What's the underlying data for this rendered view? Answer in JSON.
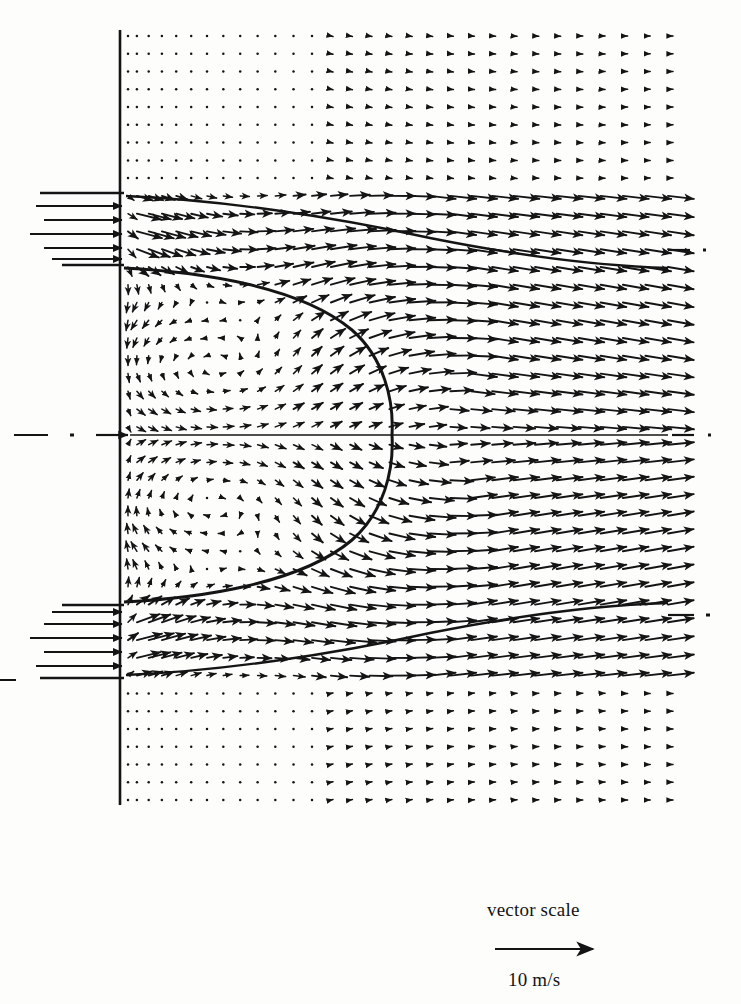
{
  "figure": {
    "kind": "vector-field-plot",
    "background_color": "#fdfdfc",
    "ink_color": "#141414"
  },
  "legend": {
    "title": "vector scale",
    "value_label": "10 m/s",
    "arrow_length_px": 100,
    "arrow_x_start": 495,
    "arrow_x_end": 595,
    "arrow_y": 949,
    "title_x": 487,
    "title_y": 916,
    "value_x": 508,
    "value_y": 986
  },
  "geometry": {
    "wall_x": 120,
    "wall_y_top": 30,
    "wall_y_bottom": 805,
    "domain_right": 672,
    "centerline_y": 435,
    "inlet_top_upper_y": 193,
    "inlet_top_lower_y": 265,
    "inlet_bottom_upper_y": 605,
    "inlet_bottom_lower_y": 678,
    "boundary_stub_x_left": 40,
    "separatrix_apex_x": 392,
    "vortex_center_upper": [
      215,
      318
    ],
    "vortex_center_lower": [
      215,
      552
    ]
  },
  "chart_data": {
    "type": "quiver",
    "title": "",
    "xlabel": "",
    "ylabel": "",
    "units": "m/s",
    "scale_reference": {
      "length_px": 100,
      "value": 10,
      "unit": "m/s"
    },
    "grid": {
      "x_min": 128,
      "x_max": 668,
      "y_min": 36,
      "y_max": 800,
      "n_cols": 30,
      "n_rows": 34
    },
    "regions": [
      {
        "name": "quiescent-top",
        "y_range": [
          36,
          188
        ],
        "magnitude": "near-zero",
        "note": "tiny dot-like vectors"
      },
      {
        "name": "inlet-jet-top",
        "y_range": [
          193,
          265
        ],
        "magnitude": "high",
        "direction": "rightward/inward"
      },
      {
        "name": "recirculation-upper",
        "y_range": [
          268,
          433
        ],
        "magnitude": "moderate",
        "direction": "clockwise vortex"
      },
      {
        "name": "recirculation-lower",
        "y_range": [
          437,
          602
        ],
        "magnitude": "moderate",
        "direction": "counter-clockwise vortex"
      },
      {
        "name": "inlet-jet-bottom",
        "y_range": [
          605,
          678
        ],
        "magnitude": "high",
        "direction": "rightward/inward"
      },
      {
        "name": "quiescent-bottom",
        "y_range": [
          682,
          800
        ],
        "magnitude": "near-zero",
        "note": "tiny dot-like vectors"
      },
      {
        "name": "downstream",
        "x_range": [
          420,
          668
        ],
        "magnitude": "high",
        "direction": "rightward"
      }
    ],
    "features": [
      {
        "name": "separatrix",
        "shape": "parabolic bubble",
        "apex": [
          392,
          435
        ]
      },
      {
        "name": "centerline",
        "style": "dash-dot",
        "y": 435
      },
      {
        "name": "inlet-wall",
        "style": "solid",
        "x": 120
      }
    ]
  },
  "marks": {
    "centerline_dashes_left": [
      [
        18,
        435
      ],
      [
        60,
        435
      ],
      [
        80,
        435
      ]
    ],
    "side_ticks_right": [
      [
        676,
        250
      ],
      [
        690,
        250
      ],
      [
        676,
        435
      ],
      [
        700,
        435
      ],
      [
        676,
        615
      ],
      [
        700,
        615
      ]
    ]
  }
}
